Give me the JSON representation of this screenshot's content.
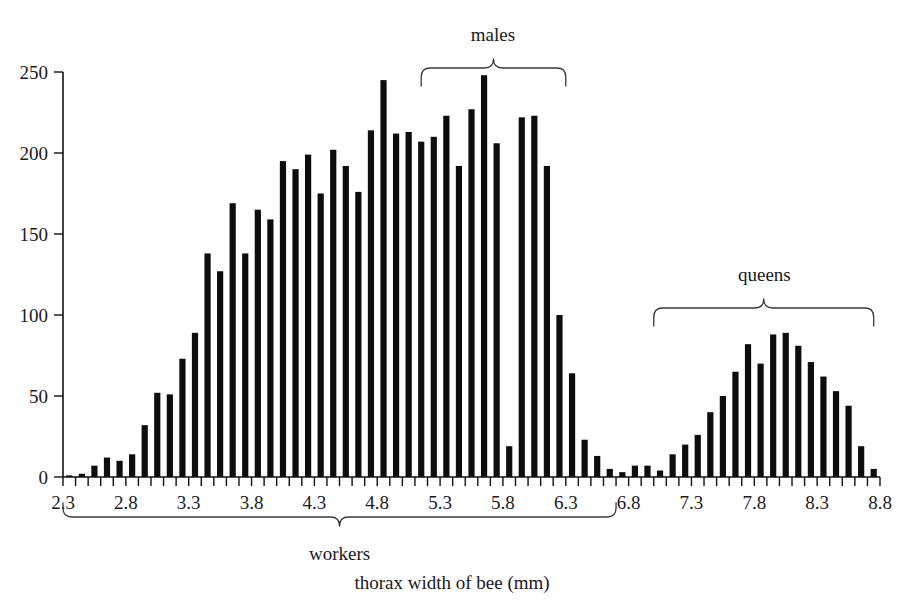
{
  "chart_data": {
    "type": "bar",
    "title": "",
    "subtitle": "",
    "xlabel": "thorax width of bee (mm)",
    "ylabel": "",
    "xlim": [
      2.3,
      8.8
    ],
    "ylim": [
      0,
      250
    ],
    "bin_width": 0.1,
    "grid": false,
    "legend_position": "none",
    "x_tick_labels": [
      "2.3",
      "2.8",
      "3.3",
      "3.8",
      "4.3",
      "4.8",
      "5.3",
      "5.8",
      "6.3",
      "6.8",
      "7.3",
      "7.8",
      "8.3",
      "8.8"
    ],
    "x_tick_values": [
      2.3,
      2.8,
      3.3,
      3.8,
      4.3,
      4.8,
      5.3,
      5.8,
      6.3,
      6.8,
      7.3,
      7.8,
      8.3,
      8.8
    ],
    "y_tick_labels": [
      "0",
      "50",
      "100",
      "150",
      "200",
      "250"
    ],
    "y_tick_values": [
      0,
      50,
      100,
      150,
      200,
      250
    ],
    "minor_tick_step": 0.1,
    "categories": [
      2.3,
      2.4,
      2.5,
      2.6,
      2.7,
      2.8,
      2.9,
      3.0,
      3.1,
      3.2,
      3.3,
      3.4,
      3.5,
      3.6,
      3.7,
      3.8,
      3.9,
      4.0,
      4.1,
      4.2,
      4.3,
      4.4,
      4.5,
      4.6,
      4.7,
      4.8,
      4.9,
      5.0,
      5.1,
      5.2,
      5.3,
      5.4,
      5.5,
      5.6,
      5.7,
      5.8,
      5.9,
      6.0,
      6.1,
      6.2,
      6.3,
      6.4,
      6.5,
      6.6,
      6.7,
      6.8,
      6.9,
      7.0,
      7.1,
      7.2,
      7.3,
      7.4,
      7.5,
      7.6,
      7.7,
      7.8,
      7.9,
      8.0,
      8.1,
      8.2,
      8.3,
      8.4,
      8.5,
      8.6,
      8.7
    ],
    "values": [
      1,
      2,
      7,
      12,
      10,
      14,
      32,
      52,
      51,
      73,
      89,
      138,
      127,
      169,
      138,
      165,
      159,
      195,
      190,
      199,
      175,
      202,
      192,
      176,
      214,
      245,
      212,
      213,
      207,
      210,
      223,
      192,
      227,
      248,
      206,
      19,
      222,
      223,
      192,
      100,
      64,
      23,
      13,
      5,
      3,
      7,
      7,
      4,
      14,
      20,
      26,
      40,
      50,
      65,
      82,
      70,
      88,
      89,
      81,
      71,
      62,
      53,
      44,
      19,
      5
    ],
    "series_name": "bee thorax width counts",
    "annotations": [
      {
        "label": "males",
        "x_start": 5.15,
        "x_end": 6.3,
        "x_center": 5.72,
        "side": "top"
      },
      {
        "label": "queens",
        "x_start": 7.0,
        "x_end": 8.75,
        "x_center": 7.88,
        "side": "top"
      },
      {
        "label": "workers",
        "x_start": 2.3,
        "x_end": 6.7,
        "x_center": 4.5,
        "side": "bottom"
      }
    ]
  },
  "annotation_labels": {
    "males": "males",
    "queens": "queens",
    "workers": "workers",
    "axis_caption": "thorax width of bee (mm)"
  },
  "colors": {
    "bar": "#0d0d0d",
    "axis": "#111111",
    "text": "#1a1a1a",
    "brace": "#3a3a3a",
    "background": "#ffffff"
  }
}
